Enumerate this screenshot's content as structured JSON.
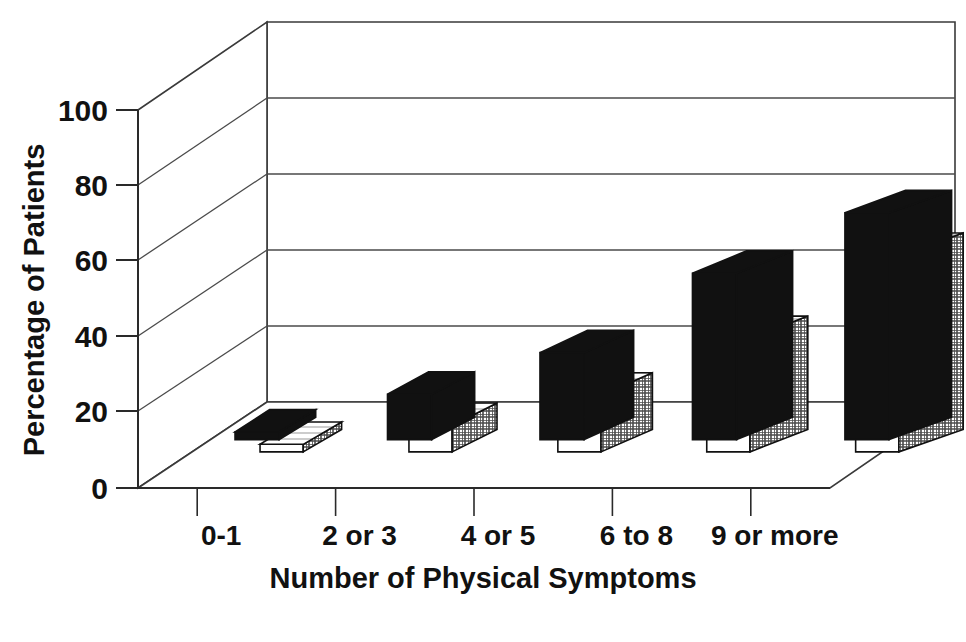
{
  "chart_data": {
    "type": "bar",
    "title": "",
    "subtitle": "",
    "xlabel": "Number of Physical Symptoms",
    "ylabel": "Percentage of Patients",
    "categories": [
      "0-1",
      "2 or 3",
      "4 or 5",
      "6 to 8",
      "9 or more"
    ],
    "series": [
      {
        "name": "series-1-black",
        "style": "solid-black",
        "values": [
          2,
          12,
          23,
          44,
          60
        ]
      },
      {
        "name": "series-2-hatched",
        "style": "white-crosshatch",
        "values": [
          2,
          7,
          15,
          30,
          52
        ]
      }
    ],
    "ylim": [
      0,
      100
    ],
    "yticks": [
      0,
      20,
      40,
      60,
      80,
      100
    ],
    "ytick_labels": [
      "0",
      "20",
      "40",
      "60",
      "80",
      "100"
    ],
    "grid": "horizontal-back-wall",
    "legend": "none",
    "legend_position": "none",
    "projection": "3d-isometric",
    "colors": {
      "bar_front_dark": "#111111",
      "bar_front_light": "#ffffff",
      "bar_top_dark": "#111111",
      "bar_side_hatch": "#6f6f6f",
      "axis": "#222222",
      "grid": "#555555",
      "background": "#ffffff"
    }
  },
  "axes": {
    "y_axis_label": "Percentage of Patients",
    "x_axis_label": "Number of Physical Symptoms"
  }
}
